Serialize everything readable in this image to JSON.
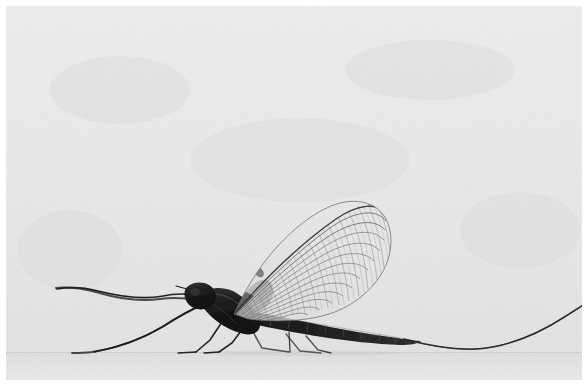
{
  "image": {
    "kind": "photograph",
    "medium": "black-and-white halftone print",
    "subject": "mayfly",
    "subject_common_name": "Mayfly (order Ephemeroptera), adult imago in profile",
    "orientation": "landscape",
    "width_px": 588,
    "height_px": 386,
    "view": "left profile, insect facing left, standing on a flat pale surface"
  },
  "colors": {
    "page_margin": "#ffffff",
    "background_sky": "#e9e9e9",
    "background_sky_upper": "#ececec",
    "background_sky_lower": "#e4e4e4",
    "ground_surface": "#e2e2e2",
    "ground_surface_far": "#e6e6e6",
    "horizon_line": "#d2d2d2",
    "body_dark": "#151515",
    "body_mid": "#3a3a3a",
    "body_shadow": "#0b0b0b",
    "leg_line": "#272727",
    "tail_filament": "#333333",
    "wing_membrane": "#e0e0e0",
    "wing_vein": "#6e6e6e",
    "wing_vein_major": "#4a4a4a",
    "grain": "#bdbdbd"
  },
  "composition": {
    "horizon_y": 352,
    "photo_left": 6,
    "photo_top": 6,
    "photo_right": 584,
    "photo_bottom": 384,
    "subject_body_span_x": [
      183,
      420
    ],
    "subject_body_span_y": [
      283,
      345
    ],
    "wing_span_x": [
      232,
      393
    ],
    "wing_span_y": [
      203,
      318
    ],
    "foreleg_reach_x": 55,
    "tail_exit_x": 588,
    "tail_exit_y": 308,
    "tail_lowest_y": 349
  },
  "anatomy": {
    "head": {
      "label": "head",
      "center_x": 196,
      "center_y": 294,
      "width": 26,
      "height": 22
    },
    "thorax": {
      "label": "thorax",
      "center_x": 232,
      "center_y": 310,
      "width": 62,
      "height": 44
    },
    "abdomen": {
      "label": "abdomen",
      "segments": 9,
      "start_x": 258,
      "end_x": 420,
      "start_y": 318,
      "end_y": 341
    },
    "forewing": {
      "label": "forewing",
      "description": "large triangular translucent forewing held upright over the back with dense reticulate venation",
      "tip_x": 391,
      "tip_y": 240,
      "base_x": 234,
      "base_y": 312,
      "apex_y": 203,
      "longitudinal_veins": 13,
      "cross_vein_rows": 16
    },
    "hindwing": {
      "label": "hindwing",
      "description": "small dark hindwing partly hidden at the forewing base",
      "center_x": 250,
      "center_y": 300
    },
    "forelegs": {
      "label": "forelegs",
      "count": 2,
      "description": "greatly elongated front legs extended forward and slightly upward to the left",
      "tip_x": 55,
      "tip_y": 288,
      "knee_x": 152,
      "knee_y": 300
    },
    "midlegs": {
      "label": "mid legs",
      "count": 2,
      "description": "thin legs angled down-forward, tarsi resting on the ground"
    },
    "hindlegs": {
      "label": "hind legs",
      "count": 2,
      "description": "thin legs supporting the abdomen, tarsi on the ground"
    },
    "cerci": {
      "label": "caudal filaments (cerci)",
      "count": 1,
      "description": "a single very long hair-thin tail filament sweeping right, dipping to graze the ground then rising off the right edge of the frame"
    }
  },
  "text": {
    "visible_text": "",
    "has_caption": false,
    "has_labels": false
  }
}
